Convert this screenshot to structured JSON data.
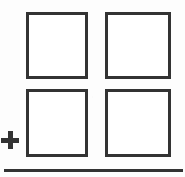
{
  "figure": {
    "kind": "line-drawing",
    "caption_text": "",
    "background_color": "#fdfdfd",
    "ink_color": "#333333",
    "fill_color": "#ffffff",
    "stroke_width_px": 3,
    "width_px": 185,
    "height_px": 177
  },
  "grid": {
    "rows": 2,
    "columns": 2,
    "cells": [
      {
        "id": "top-left",
        "label": "",
        "x": 26,
        "y": 12,
        "w": 62,
        "h": 67
      },
      {
        "id": "top-right",
        "label": "",
        "x": 105,
        "y": 12,
        "w": 66,
        "h": 67
      },
      {
        "id": "bottom-left",
        "label": "",
        "x": 26,
        "y": 89,
        "w": 62,
        "h": 68
      },
      {
        "id": "bottom-right",
        "label": "",
        "x": 105,
        "y": 89,
        "w": 66,
        "h": 68
      }
    ]
  },
  "annotations": {
    "plus_symbol": {
      "glyph": "+",
      "x": 1,
      "y": 131,
      "size": 18,
      "thickness": 5
    },
    "baseline_rule": {
      "x": 4,
      "y": 169,
      "width": 179,
      "thickness": 3
    }
  }
}
